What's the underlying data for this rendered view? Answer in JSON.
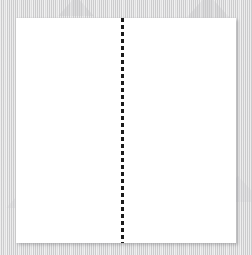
{
  "canvas": {
    "width": 252,
    "height": 255,
    "background_color": "#d6d6d7",
    "background_texture": "vertical-stripe-noise"
  },
  "background": {
    "name": "textured-gray-backdrop",
    "watermarks": [
      {
        "name": "triangle-watermark",
        "color": "#c6c6c8"
      },
      {
        "name": "triangle-watermark",
        "color": "#c6c6c8"
      },
      {
        "name": "triangle-watermark",
        "color": "#cacacc"
      },
      {
        "name": "triangle-watermark",
        "color": "#cacacc"
      }
    ]
  },
  "page": {
    "name": "white-sheet",
    "fill_color": "#ffffff",
    "x": 16,
    "y": 18,
    "width": 220,
    "height": 225,
    "shadow_color": "rgba(120,120,124,0.40)",
    "content": ""
  },
  "fold_line": {
    "name": "vertical-dashed-fold-line",
    "orientation": "vertical",
    "color": "#1a1a1a",
    "stroke_width": 3,
    "dash_length": 4,
    "gap_length": 3,
    "x_offset": 105,
    "length": 225
  },
  "panels": [
    {
      "name": "left-panel",
      "label": "",
      "content": ""
    },
    {
      "name": "right-panel",
      "label": "",
      "content": ""
    }
  ]
}
